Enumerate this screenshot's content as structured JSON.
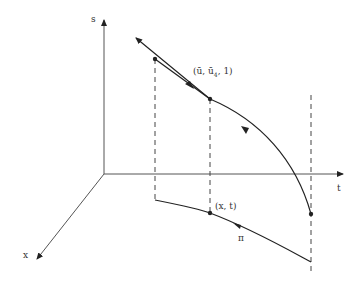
{
  "diagram": {
    "axes": {
      "s_label": "s",
      "t_label": "t",
      "x_label": "x"
    },
    "points": {
      "upper_label_u": "(ū, ū",
      "upper_label_sub": "4",
      "upper_label_tail": ", 1)",
      "lower_label": "(x, t)"
    },
    "curve_label": "π",
    "stroke_color": "#222222",
    "axis_color": "#555555"
  }
}
